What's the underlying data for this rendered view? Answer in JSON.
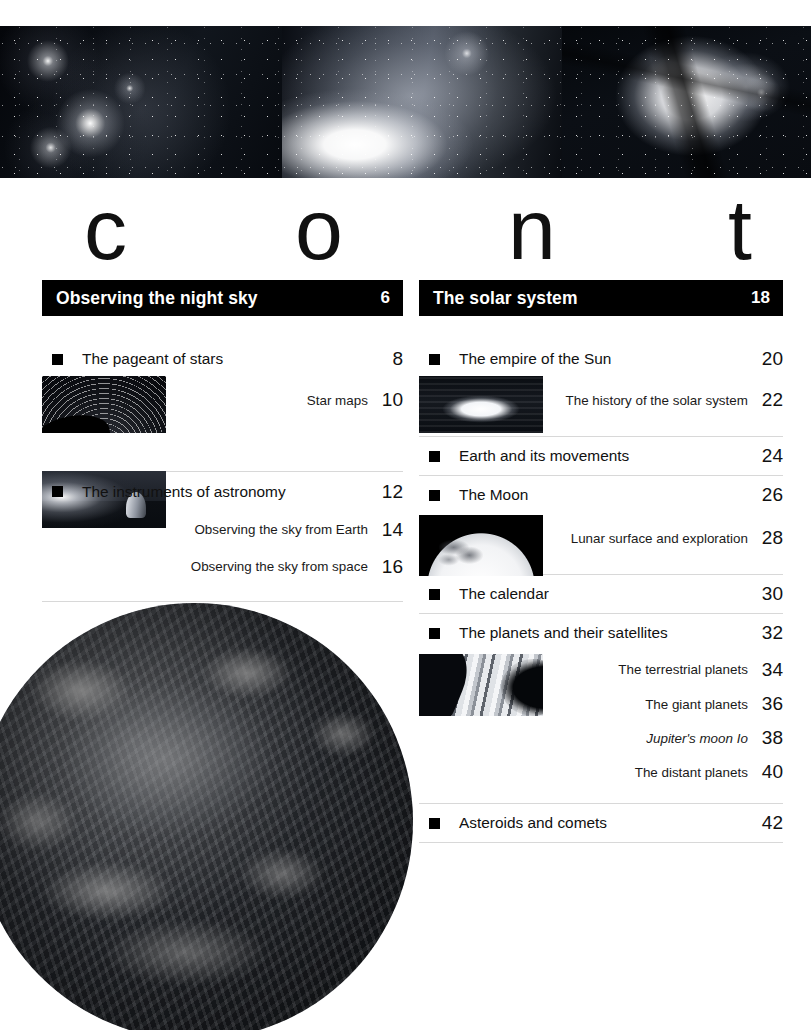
{
  "banner": {
    "images": [
      {
        "name": "nebula-with-bright-stars",
        "caption": ""
      },
      {
        "name": "comet-and-dust-cloud",
        "caption": ""
      },
      {
        "name": "trifid-nebula",
        "caption": ""
      }
    ]
  },
  "masthead": {
    "letters": [
      "c",
      "o",
      "n",
      "t"
    ]
  },
  "columns": [
    {
      "id": "left",
      "header": {
        "title": "Observing the night sky",
        "page": "6"
      },
      "entries": [
        {
          "type": "main",
          "title": "The pageant of stars",
          "page": "8"
        },
        {
          "type": "sub",
          "title": "Star maps",
          "page": "10"
        },
        {
          "type": "main",
          "title": "The instruments of astronomy",
          "page": "12"
        },
        {
          "type": "sub",
          "title": "Observing the sky from Earth",
          "page": "14"
        },
        {
          "type": "sub",
          "title": "Observing the sky from space",
          "page": "16"
        }
      ],
      "thumbnails": [
        {
          "name": "star-trails-thumbnail"
        },
        {
          "name": "observatory-dome-thumbnail"
        }
      ]
    },
    {
      "id": "right",
      "header": {
        "title": "The solar system",
        "page": "18"
      },
      "entries": [
        {
          "type": "main",
          "title": "The empire of the Sun",
          "page": "20"
        },
        {
          "type": "sub",
          "title": "The history of the solar system",
          "page": "22"
        },
        {
          "type": "main",
          "title": "Earth and its movements",
          "page": "24"
        },
        {
          "type": "main",
          "title": "The Moon",
          "page": "26"
        },
        {
          "type": "sub",
          "title": "Lunar surface and exploration",
          "page": "28"
        },
        {
          "type": "main",
          "title": "The calendar",
          "page": "30"
        },
        {
          "type": "main",
          "title": "The planets and their satellites",
          "page": "32"
        },
        {
          "type": "sub",
          "title": "The terrestrial planets",
          "page": "34"
        },
        {
          "type": "sub",
          "title": "The giant planets",
          "page": "36"
        },
        {
          "type": "sub",
          "title": "Jupiter's moon Io",
          "page": "38",
          "italic": true
        },
        {
          "type": "sub",
          "title": "The distant planets",
          "page": "40"
        },
        {
          "type": "main",
          "title": "Asteroids and comets",
          "page": "42"
        }
      ],
      "thumbnails": [
        {
          "name": "sun-thumbnail"
        },
        {
          "name": "moon-thumbnail"
        },
        {
          "name": "saturn-rings-thumbnail"
        }
      ]
    }
  ],
  "feature_image": {
    "name": "earth-from-space"
  },
  "colors": {
    "header_bar": "#000000",
    "header_text": "#ffffff",
    "body_text": "#111111",
    "rule": "#d8d8d8",
    "page_background": "#ffffff"
  }
}
